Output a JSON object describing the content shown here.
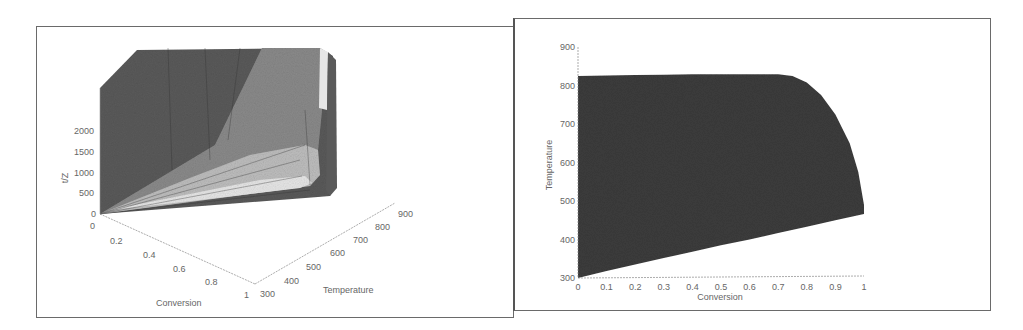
{
  "chart_data": [
    {
      "type": "surface3d",
      "title": "",
      "xlabel": "Conversion",
      "ylabel": "Temperature",
      "zlabel": "t/Z",
      "x_ticks": [
        "0",
        "0.2",
        "0.4",
        "0.6",
        "0.8",
        "1"
      ],
      "y_ticks": [
        "300",
        "400",
        "500",
        "600",
        "700",
        "800",
        "900"
      ],
      "z_ticks": [
        "0",
        "500",
        "1000",
        "1500",
        "2000"
      ],
      "xlim": [
        0,
        1
      ],
      "ylim": [
        300,
        900
      ],
      "zlim": [
        0,
        2500
      ],
      "colors": {
        "surface_dark": "#5a5a5a",
        "surface_mid": "#8a8a8a",
        "surface_light": "#bdbdbd",
        "surface_highlight": "#e6e6e6"
      }
    },
    {
      "type": "area",
      "title": "",
      "xlabel": "Conversion",
      "ylabel": "Temperature",
      "x_ticks": [
        "0",
        "0.1",
        "0.2",
        "0.3",
        "0.4",
        "0.5",
        "0.6",
        "0.7",
        "0.8",
        "0.9",
        "1"
      ],
      "y_ticks": [
        "300",
        "400",
        "500",
        "600",
        "700",
        "800",
        "900"
      ],
      "xlim": [
        0,
        1
      ],
      "ylim": [
        300,
        900
      ],
      "region_upper_boundary": {
        "x": [
          0,
          0.1,
          0.2,
          0.3,
          0.4,
          0.5,
          0.6,
          0.7,
          0.75,
          0.8,
          0.85,
          0.9,
          0.95,
          0.98,
          1.0
        ],
        "y": [
          825,
          826,
          827,
          828,
          829,
          829,
          829,
          829,
          825,
          808,
          775,
          725,
          650,
          575,
          490
        ]
      },
      "region_lower_boundary": {
        "x": [
          0,
          0.1,
          0.2,
          0.3,
          0.4,
          0.5,
          0.6,
          0.7,
          0.8,
          0.9,
          1.0
        ],
        "y": [
          300,
          318,
          335,
          352,
          368,
          385,
          400,
          417,
          433,
          450,
          466
        ]
      },
      "colors": {
        "fill": "#3c3c3c"
      }
    }
  ]
}
